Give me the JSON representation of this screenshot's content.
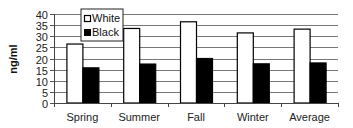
{
  "chart_data": {
    "type": "bar",
    "title": "",
    "xlabel": "",
    "ylabel": "ng/ml",
    "ylim": [
      0,
      40
    ],
    "yticks": [
      0,
      5,
      10,
      15,
      20,
      25,
      30,
      35,
      40
    ],
    "grid": true,
    "legend_position": "upper-left-inside",
    "categories": [
      "Spring",
      "Summer",
      "Fall",
      "Winter",
      "Average"
    ],
    "series": [
      {
        "name": "White",
        "color": "#ffffff",
        "values": [
          26.5,
          33.5,
          36.5,
          31.5,
          33.2
        ]
      },
      {
        "name": "Black",
        "color": "#000000",
        "values": [
          15.8,
          17.5,
          20.0,
          17.6,
          18.0
        ]
      }
    ]
  }
}
